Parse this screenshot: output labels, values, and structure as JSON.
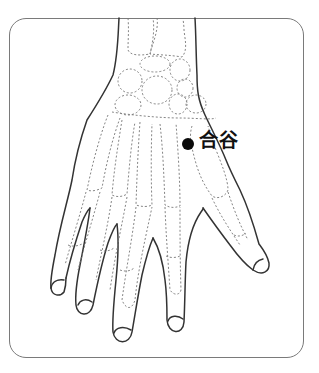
{
  "figure": {
    "type": "acupuncture point illustration",
    "point": {
      "label": "合谷",
      "marker_color": "#0a0a0a"
    },
    "colors": {
      "outline": "#333333",
      "bones_dashed": "#777777",
      "frame_border": "#7a7a7a",
      "background": "#ffffff"
    }
  }
}
